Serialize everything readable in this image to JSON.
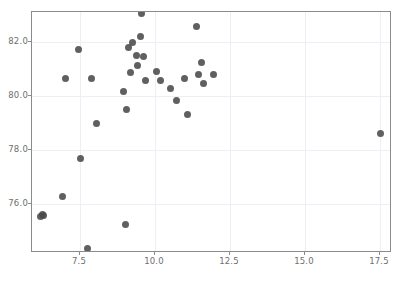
{
  "chart_data": {
    "type": "scatter",
    "title": "",
    "xlabel": "",
    "ylabel": "",
    "xlim": [
      5.9,
      17.9
    ],
    "ylim": [
      74.2,
      83.1
    ],
    "grid": true,
    "legend": null,
    "marker": {
      "color": "#4a4a4a",
      "shape": "circle",
      "size": 7,
      "opacity": 0.88
    },
    "xticks": [
      "7.5",
      "10.0",
      "12.5",
      "15.0",
      "17.5"
    ],
    "xtick_values": [
      7.5,
      10.0,
      12.5,
      15.0,
      17.5
    ],
    "yticks": [
      "76.0",
      "78.0",
      "80.0",
      "82.0"
    ],
    "ytick_values": [
      76.0,
      78.0,
      80.0,
      82.0
    ],
    "points": [
      {
        "x": 6.18,
        "y": 75.55
      },
      {
        "x": 6.25,
        "y": 75.62
      },
      {
        "x": 6.28,
        "y": 75.6
      },
      {
        "x": 6.9,
        "y": 76.28
      },
      {
        "x": 7.0,
        "y": 80.66
      },
      {
        "x": 7.45,
        "y": 81.72
      },
      {
        "x": 7.52,
        "y": 77.7
      },
      {
        "x": 7.75,
        "y": 74.35
      },
      {
        "x": 7.88,
        "y": 80.66
      },
      {
        "x": 8.05,
        "y": 78.98
      },
      {
        "x": 8.95,
        "y": 80.16
      },
      {
        "x": 9.0,
        "y": 75.25
      },
      {
        "x": 9.05,
        "y": 79.5
      },
      {
        "x": 9.12,
        "y": 81.8
      },
      {
        "x": 9.18,
        "y": 80.88
      },
      {
        "x": 9.25,
        "y": 81.98
      },
      {
        "x": 9.38,
        "y": 81.48
      },
      {
        "x": 9.42,
        "y": 81.12
      },
      {
        "x": 9.52,
        "y": 82.18
      },
      {
        "x": 9.55,
        "y": 83.05
      },
      {
        "x": 9.6,
        "y": 81.45
      },
      {
        "x": 9.68,
        "y": 80.58
      },
      {
        "x": 10.05,
        "y": 80.92
      },
      {
        "x": 10.18,
        "y": 80.58
      },
      {
        "x": 10.52,
        "y": 80.28
      },
      {
        "x": 10.72,
        "y": 79.82
      },
      {
        "x": 10.98,
        "y": 80.66
      },
      {
        "x": 11.08,
        "y": 79.3
      },
      {
        "x": 11.38,
        "y": 82.55
      },
      {
        "x": 11.45,
        "y": 80.78
      },
      {
        "x": 11.55,
        "y": 81.25
      },
      {
        "x": 11.62,
        "y": 80.45
      },
      {
        "x": 11.95,
        "y": 80.78
      },
      {
        "x": 17.52,
        "y": 78.62
      }
    ],
    "n_points": 34
  },
  "figure": {
    "background": "#ffffff",
    "axes_edge_color": "#8b8b8b",
    "grid_color": "#eceff4",
    "tick_label_color": "#6e6e6e"
  }
}
